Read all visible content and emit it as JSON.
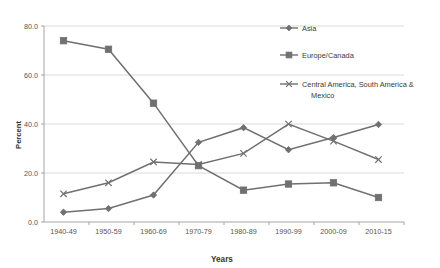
{
  "chart_data": {
    "type": "line",
    "title": "",
    "xlabel": "Years",
    "ylabel": "Percent",
    "categories": [
      "1940-49",
      "1950-59",
      "1960-69",
      "1970-79",
      "1980-89",
      "1990-99",
      "2000-09",
      "2010-15"
    ],
    "ylim": [
      0,
      80
    ],
    "yticks": [
      "0.0",
      "20.0",
      "40.0",
      "60.0",
      "80.0"
    ],
    "ytick_values": [
      0,
      20,
      40,
      60,
      80
    ],
    "grid": "horizontal",
    "legend_position": "upper-right-outside",
    "series": [
      {
        "name": "Asia",
        "marker": "diamond",
        "color": "#707070",
        "values": [
          4.0,
          5.5,
          11.0,
          32.5,
          38.5,
          29.5,
          34.5,
          39.8
        ]
      },
      {
        "name": "Europe/Canada",
        "marker": "square",
        "color": "#707070",
        "values": [
          74.0,
          70.5,
          48.5,
          23.0,
          13.0,
          15.5,
          16.0,
          10.0
        ]
      },
      {
        "name": "Central America, South America & Mexico",
        "marker": "cross",
        "color": "#707070",
        "values": [
          11.5,
          16.0,
          24.5,
          23.5,
          28.0,
          40.0,
          33.0,
          25.5
        ]
      }
    ]
  },
  "legend": {
    "items": [
      {
        "label": "Asia"
      },
      {
        "label": "Europe/Canada"
      },
      {
        "label": "Central America, South America &"
      },
      {
        "label": "Mexico"
      }
    ]
  }
}
